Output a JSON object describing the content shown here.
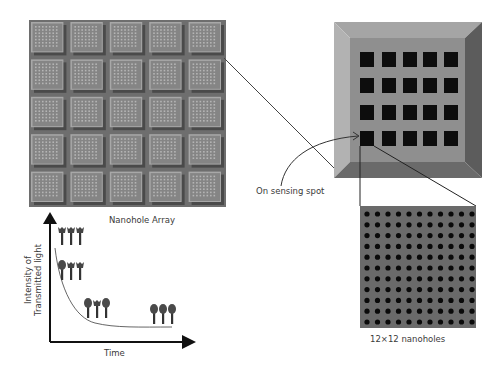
{
  "labels": {
    "nanohole_array": "Nanohole Array",
    "on_sensing_spot": "On sensing spot",
    "nanoholes_count": "12×12 nanoholes",
    "y_axis_line1": "Intensity of",
    "y_axis_line2": "Transmitted light",
    "x_axis": "Time"
  },
  "nanohole_array": {
    "rows": 5,
    "cols": 5,
    "sub_holes_per_side": 7
  },
  "chip": {
    "hole_rows": 4,
    "hole_cols": 5,
    "highlighted_hole": {
      "row": 3,
      "col": 0
    }
  },
  "zoom_panel": {
    "dot_rows": 11,
    "dot_cols": 11
  },
  "molecule_groups": [
    {
      "x": 62,
      "y": 227,
      "types": [
        "empty",
        "empty",
        "empty"
      ]
    },
    {
      "x": 62,
      "y": 262,
      "types": [
        "bound",
        "empty",
        "empty"
      ]
    },
    {
      "x": 88,
      "y": 300,
      "types": [
        "bound",
        "empty",
        "bound"
      ]
    },
    {
      "x": 154,
      "y": 306,
      "types": [
        "bound",
        "bound",
        "bound"
      ]
    }
  ],
  "chart_data": {
    "type": "line",
    "title": "",
    "xlabel": "Time",
    "ylabel": "Intensity of Transmitted light",
    "x": [
      0,
      1,
      2,
      3,
      4,
      5,
      6,
      7,
      8,
      9,
      10
    ],
    "y": [
      1.0,
      0.55,
      0.32,
      0.18,
      0.1,
      0.06,
      0.04,
      0.03,
      0.02,
      0.02,
      0.02
    ],
    "grid": false
  },
  "colors": {
    "array_base": "#6e6e6e",
    "tile_face": "#858585",
    "tile_highlight": "#a8a8a8",
    "tile_shadow": "#4a4a4a",
    "chip_face": "#8f8f8f",
    "chip_top": "#a5a5a5",
    "chip_right": "#5c5c5c",
    "chip_bottom": "#6a6a6a",
    "hole": "#0d0d0d",
    "panel": "#6a6a6a",
    "dot": "#0a0a0a",
    "line": "#444444",
    "axis": "#111111"
  }
}
